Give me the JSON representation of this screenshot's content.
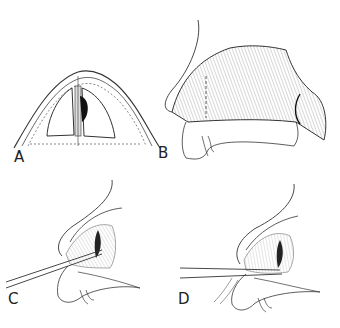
{
  "figure": {
    "panels": [
      {
        "id": "A",
        "label": "A",
        "description": "Coronal cross-section of nose showing septum with dark lesion"
      },
      {
        "id": "B",
        "label": "B",
        "description": "Lateral view of nose with hatched septal region and dashed incision line"
      },
      {
        "id": "C",
        "label": "C",
        "description": "Lateral view with instrument inserted into nostril"
      },
      {
        "id": "D",
        "label": "D",
        "description": "Lateral view with instrument inserted, retracted flap"
      }
    ],
    "colors": {
      "line": "#333333",
      "fill_dark": "#111111",
      "background": "#ffffff"
    }
  }
}
